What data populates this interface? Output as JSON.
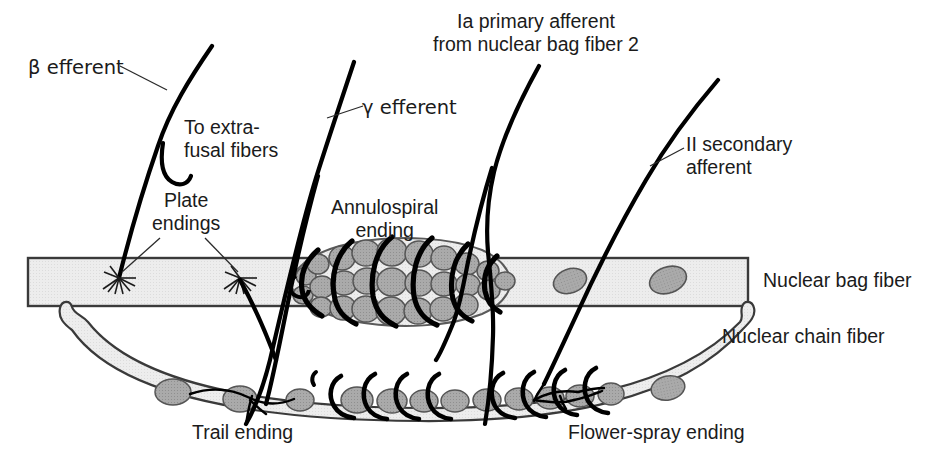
{
  "figure": {
    "background_color": "#ffffff",
    "ink_color": "#1b1b1b",
    "fiber_fill": "#ededed",
    "nucleus_fill": "#a9a9a9",
    "nucleus_stroke": "#4a4a4a"
  },
  "labels": {
    "beta_efferent": "β efferent",
    "to_extrafusal": "To extra-\nfusal fibers",
    "plate_endings": "Plate\nendings",
    "gamma_efferent": "γ efferent",
    "annulospiral_ending": "Annulospiral\nending",
    "ia_primary_afferent": "Ia primary afferent\nfrom nuclear bag fiber 2",
    "ii_secondary_afferent": "II secondary\nafferent",
    "nuclear_bag_fiber": "Nuclear bag fiber",
    "nuclear_chain_fiber": "Nuclear chain fiber",
    "trail_ending": "Trail ending",
    "flower_spray_ending": "Flower-spray ending"
  },
  "structures": {
    "nuclear_bag_fiber": {
      "name": "nuclear-bag-fiber",
      "description": "Horizontal banded muscle fiber spanning the figure width",
      "nuclei_count": 2,
      "plate_ending_count": 2
    },
    "nuclear_chain_fiber": {
      "name": "nuclear-chain-fiber",
      "description": "Lower curved muscle fiber with a chain of nuclei",
      "nuclei_count": 13
    },
    "annulospiral_ending": {
      "name": "annulospiral-ending",
      "description": "Bulging nuclear bag region packed with nuclei and wrapped by spiral nerve coils",
      "spiral_wrap_count": 6
    },
    "trail_ending": {
      "name": "trail-ending",
      "description": "Fine branching gamma motor terminal on the nuclear chain fiber"
    },
    "flower_spray_ending": {
      "name": "flower-spray-ending",
      "description": "Branched sensory terminal of the II secondary afferent on the chain fiber"
    }
  },
  "nerves": [
    {
      "name": "beta-efferent",
      "label": "β efferent",
      "type": "efferent"
    },
    {
      "name": "gamma-efferent",
      "label": "γ efferent",
      "type": "efferent"
    },
    {
      "name": "ia-primary-afferent",
      "label": "Ia primary afferent",
      "type": "afferent"
    },
    {
      "name": "ii-secondary-afferent",
      "label": "II secondary afferent",
      "type": "afferent"
    }
  ]
}
